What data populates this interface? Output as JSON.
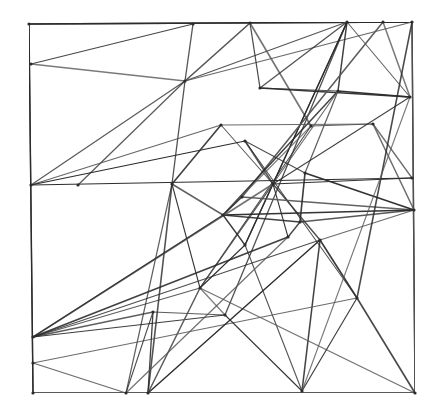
{
  "drawing": {
    "description": "Hand-drawn pencil sketch of a square frame filled with intersecting straight lines forming an irregular triangulated mesh",
    "medium": "graphite on white paper",
    "colors": {
      "paper": "#ffffff",
      "line": "#2b2b2b",
      "line_light": "#555555"
    },
    "width": 446,
    "height": 411,
    "frame": [
      [
        29,
        24
      ],
      [
        412,
        22
      ],
      [
        415,
        393
      ],
      [
        33,
        393
      ]
    ],
    "nodes": {
      "A": [
        29,
        24
      ],
      "B": [
        193,
        24
      ],
      "C": [
        250,
        23
      ],
      "D": [
        347,
        22
      ],
      "E": [
        383,
        22
      ],
      "F": [
        412,
        22
      ],
      "G": [
        31,
        64
      ],
      "H": [
        31,
        185
      ],
      "I": [
        33,
        337
      ],
      "J": [
        33,
        363
      ],
      "K": [
        33,
        393
      ],
      "L": [
        410,
        97
      ],
      "M": [
        412,
        178
      ],
      "N": [
        414,
        210
      ],
      "O": [
        415,
        393
      ],
      "P": [
        185,
        81
      ],
      "Q": [
        260,
        88
      ],
      "R": [
        338,
        91
      ],
      "S": [
        221,
        125
      ],
      "T": [
        245,
        141
      ],
      "U": [
        311,
        126
      ],
      "V": [
        373,
        124
      ],
      "W": [
        172,
        184
      ],
      "X": [
        273,
        184
      ],
      "Y": [
        242,
        197
      ],
      "Z": [
        305,
        173
      ],
      "a": [
        223,
        215
      ],
      "b": [
        300,
        222
      ],
      "c": [
        245,
        245
      ],
      "d": [
        320,
        240
      ],
      "e": [
        288,
        237
      ],
      "f": [
        200,
        288
      ],
      "g": [
        153,
        312
      ],
      "h": [
        225,
        315
      ],
      "i": [
        357,
        298
      ],
      "j": [
        126,
        393
      ],
      "k": [
        148,
        393
      ],
      "l": [
        302,
        391
      ],
      "m": [
        78,
        185
      ]
    },
    "segments": [
      [
        "A",
        "F"
      ],
      [
        "F",
        "O"
      ],
      [
        "O",
        "K"
      ],
      [
        "K",
        "A"
      ],
      [
        "G",
        "B"
      ],
      [
        "G",
        "P"
      ],
      [
        "P",
        "B"
      ],
      [
        "P",
        "C"
      ],
      [
        "P",
        "D"
      ],
      [
        "P",
        "F"
      ],
      [
        "P",
        "H"
      ],
      [
        "P",
        "W"
      ],
      [
        "P",
        "m"
      ],
      [
        "C",
        "Q"
      ],
      [
        "C",
        "U"
      ],
      [
        "Q",
        "D"
      ],
      [
        "Q",
        "L"
      ],
      [
        "Q",
        "R"
      ],
      [
        "D",
        "L"
      ],
      [
        "D",
        "R"
      ],
      [
        "D",
        "X"
      ],
      [
        "D",
        "c"
      ],
      [
        "D",
        "h"
      ],
      [
        "E",
        "L"
      ],
      [
        "E",
        "Y"
      ],
      [
        "R",
        "L"
      ],
      [
        "R",
        "a"
      ],
      [
        "R",
        "f"
      ],
      [
        "R",
        "Z"
      ],
      [
        "H",
        "M"
      ],
      [
        "H",
        "S"
      ],
      [
        "H",
        "T"
      ],
      [
        "W",
        "S"
      ],
      [
        "W",
        "f"
      ],
      [
        "W",
        "j"
      ],
      [
        "W",
        "a"
      ],
      [
        "W",
        "k"
      ],
      [
        "S",
        "X"
      ],
      [
        "S",
        "V"
      ],
      [
        "T",
        "X"
      ],
      [
        "T",
        "i"
      ],
      [
        "T",
        "Z"
      ],
      [
        "U",
        "V"
      ],
      [
        "U",
        "a"
      ],
      [
        "U",
        "f"
      ],
      [
        "V",
        "M"
      ],
      [
        "V",
        "N"
      ],
      [
        "X",
        "M"
      ],
      [
        "X",
        "d"
      ],
      [
        "X",
        "e"
      ],
      [
        "X",
        "f"
      ],
      [
        "X",
        "L"
      ],
      [
        "X",
        "c"
      ],
      [
        "Y",
        "a"
      ],
      [
        "Y",
        "N"
      ],
      [
        "Z",
        "b"
      ],
      [
        "Z",
        "N"
      ],
      [
        "a",
        "c"
      ],
      [
        "a",
        "b"
      ],
      [
        "a",
        "N"
      ],
      [
        "c",
        "f"
      ],
      [
        "e",
        "b"
      ],
      [
        "d",
        "l"
      ],
      [
        "d",
        "i"
      ],
      [
        "d",
        "N"
      ],
      [
        "b",
        "N"
      ],
      [
        "c",
        "l"
      ],
      [
        "I",
        "f"
      ],
      [
        "I",
        "g"
      ],
      [
        "I",
        "h"
      ],
      [
        "I",
        "X"
      ],
      [
        "I",
        "a"
      ],
      [
        "I",
        "d"
      ],
      [
        "I",
        "e"
      ],
      [
        "J",
        "i"
      ],
      [
        "J",
        "j"
      ],
      [
        "g",
        "h"
      ],
      [
        "g",
        "k"
      ],
      [
        "g",
        "j"
      ],
      [
        "f",
        "h"
      ],
      [
        "f",
        "k"
      ],
      [
        "f",
        "O"
      ],
      [
        "h",
        "l"
      ],
      [
        "i",
        "l"
      ],
      [
        "i",
        "O"
      ],
      [
        "i",
        "F"
      ],
      [
        "l",
        "L"
      ],
      [
        "k",
        "d"
      ],
      [
        "j",
        "e"
      ]
    ]
  }
}
